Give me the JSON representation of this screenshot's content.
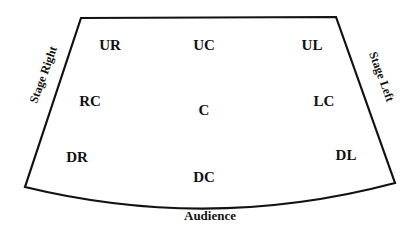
{
  "diagram": {
    "type": "stage-areas",
    "outline_color": "#111111",
    "background": "#ffffff",
    "areas": {
      "ur": "UR",
      "uc": "UC",
      "ul": "UL",
      "rc": "RC",
      "c": "C",
      "lc": "LC",
      "dr": "DR",
      "dc": "DC",
      "dl": "DL"
    },
    "sides": {
      "left_side": "Stage Right",
      "right_side": "Stage Left"
    },
    "front": "Audience"
  }
}
